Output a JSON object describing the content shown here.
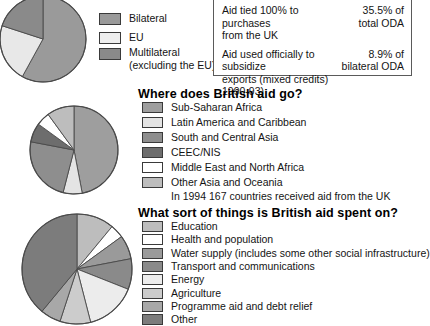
{
  "chart_data": [
    {
      "type": "pie",
      "title": "",
      "id": "uk-aid-channel",
      "categories": [
        "Bilateral",
        "EU",
        "Multilateral (excluding the EU)"
      ],
      "values": [
        58,
        22,
        20
      ],
      "colors": [
        "#9a9a9a",
        "#e8e8e8",
        "#8a8a8a"
      ],
      "legend_position": "right",
      "note": "pie is cropped by the left and top edges of the image"
    },
    {
      "type": "pie",
      "title": "Where does British aid go?",
      "id": "aid-destination",
      "categories": [
        "Sub-Saharan Africa",
        "Latin America and Caribbean",
        "South and Central Asia",
        "CEEC/NIS",
        "Middle East and North Africa",
        "Other Asia and Oceania"
      ],
      "values": [
        47,
        7,
        24,
        7,
        5,
        10
      ],
      "colors": [
        "#9e9e9e",
        "#e4e4e4",
        "#8e8e8e",
        "#6d6d6d",
        "#ffffff",
        "#bdbdbd"
      ],
      "legend_position": "right"
    },
    {
      "type": "pie",
      "title": "What sort of things is British aid spent on?",
      "id": "aid-sector",
      "categories": [
        "Education",
        "Health and population",
        "Water supply (includes some other social infrastructure)",
        "Transport and communications",
        "Energy",
        "Agriculture",
        "Programme aid and debt relief",
        "Other"
      ],
      "values": [
        11,
        4,
        7,
        9,
        15,
        9,
        6,
        39
      ],
      "colors": [
        "#bdbdbd",
        "#ffffff",
        "#9a9a9a",
        "#8a8a8a",
        "#ececec",
        "#cccccc",
        "#a8a8a8",
        "#7c7c7c"
      ],
      "legend_position": "right"
    }
  ],
  "pie1": {
    "legend": [
      {
        "label": "Bilateral",
        "label2": ""
      },
      {
        "label": "EU",
        "label2": ""
      },
      {
        "label": "Multilateral",
        "label2": "(excluding the EU)"
      }
    ]
  },
  "infobox": {
    "rows": [
      {
        "line1": "Aid tied 100% to purchases",
        "line2": "from the UK",
        "value1": "35.5% of",
        "value2": "total ODA"
      },
      {
        "line1": "Aid used officially to subsidize",
        "line2": "exports (mixed credits)",
        "line3": "1990-93)",
        "value1": "8.9% of",
        "value2": "bilateral ODA"
      }
    ]
  },
  "section2": {
    "heading": "Where does British aid go?",
    "legend": [
      "Sub-Saharan Africa",
      "Latin America and Caribbean",
      "South and Central Asia",
      "CEEC/NIS",
      "Middle East and North Africa",
      "Other Asia and Oceania"
    ],
    "footnote": "In 1994 167 countries received aid from the UK"
  },
  "section3": {
    "heading": "What sort of things is British aid spent on?",
    "legend": [
      "Education",
      "Health and population",
      "Water supply (includes some other social infrastructure)",
      "Transport and communications",
      "Energy",
      "Agriculture",
      "Programme aid and debt relief",
      "Other"
    ]
  }
}
